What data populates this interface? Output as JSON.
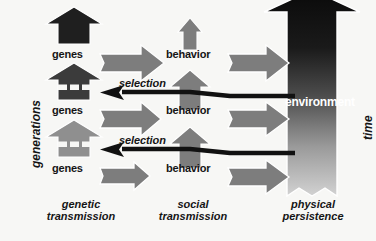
{
  "diagram": {
    "background_color": "#f7f7f5",
    "axes": {
      "left_label": "generations",
      "right_label": "time"
    },
    "column_labels": [
      {
        "id": "genetic",
        "text": "genetic\ntransmission"
      },
      {
        "id": "social",
        "text": "social\ntransmission"
      },
      {
        "id": "physical",
        "text": "physical\npersistence"
      }
    ],
    "nodes": {
      "genes": [
        "genes",
        "genes",
        "genes"
      ],
      "behavior": [
        "behavior",
        "behavior",
        "behavior"
      ],
      "environment": "environment"
    },
    "edge_labels": [
      "selection",
      "selection"
    ],
    "colors": {
      "genes_dark": "#1f1f1f",
      "genes_mid": "#4a4a4a",
      "genes_light": "#8f8f8f",
      "arrow_gray": "#7d7d7d",
      "arrow_outline": "#ffffff",
      "selection_black": "#111111",
      "environment_top": "#0d0d0d",
      "environment_bottom": "#cfcfcf",
      "text": "#151515",
      "environment_text": "#ffffff"
    }
  }
}
